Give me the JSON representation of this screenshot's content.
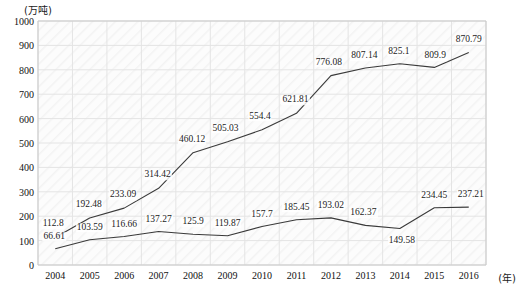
{
  "chart_data": {
    "type": "line",
    "title": "",
    "subtitle": "",
    "xlabel": "(年)",
    "ylabel": "(万吨)",
    "unit_top_left": "(万吨)",
    "unit_bottom_right": "(年)",
    "grid": true,
    "legend_position": "none",
    "xlim": [
      2004,
      2016
    ],
    "ylim": [
      0,
      1000
    ],
    "ytick_step": 100,
    "categories": [
      "2004",
      "2005",
      "2006",
      "2007",
      "2008",
      "2009",
      "2010",
      "2011",
      "2012",
      "2013",
      "2014",
      "2015",
      "2016"
    ],
    "yticks": [
      "0",
      "100",
      "200",
      "300",
      "400",
      "500",
      "600",
      "700",
      "800",
      "900",
      "1000"
    ],
    "series": [
      {
        "name": "upper-series",
        "color": "#3a3a3a",
        "values": [
          112.8,
          192.48,
          233.09,
          314.42,
          460.12,
          505.03,
          554.4,
          621.81,
          776.08,
          807.14,
          825.1,
          809.9,
          870.79
        ],
        "labels": [
          "112.8",
          "192.48",
          "233.09",
          "314.42",
          "460.12",
          "505.03",
          "554.4",
          "621.81",
          "776.08",
          "807.14",
          "825.1",
          "809.9",
          "870.79"
        ]
      },
      {
        "name": "lower-series",
        "color": "#3a3a3a",
        "values": [
          66.61,
          103.59,
          116.66,
          137.27,
          125.9,
          119.87,
          157.7,
          185.45,
          193.02,
          162.37,
          149.58,
          234.45,
          237.21
        ],
        "labels": [
          "66.61",
          "103.59",
          "116.66",
          "137.27",
          "125.9",
          "119.87",
          "157.7",
          "185.45",
          "193.02",
          "162.37",
          "149.58",
          "234.45",
          "237.21"
        ]
      }
    ]
  },
  "axis": {
    "y_unit": "(万吨)",
    "x_unit": "(年)"
  },
  "colors": {
    "line": "#3a3a3a",
    "grid": "#e3e3e3",
    "axis_text": "#111111",
    "plot_bg": "#fbfbfb"
  }
}
